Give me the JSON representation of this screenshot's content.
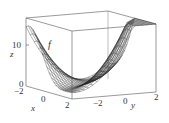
{
  "figure": {
    "type": "3d-surface",
    "function_label": "f",
    "axes": {
      "x": {
        "label": "x",
        "ticks": [
          "−2",
          "0",
          "2"
        ],
        "range": [
          -2,
          2
        ]
      },
      "y": {
        "label": "y",
        "ticks": [
          "−2",
          "0",
          "2"
        ],
        "range": [
          -2,
          2
        ]
      },
      "z": {
        "label": "z",
        "ticks": [
          "0",
          "10"
        ],
        "range": [
          0,
          17
        ]
      }
    },
    "colors": {
      "mesh": "#222222",
      "box": "#555555",
      "background": "#ffffff"
    }
  }
}
